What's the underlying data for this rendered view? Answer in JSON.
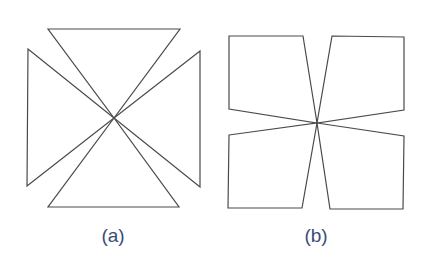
{
  "figure": {
    "line_color": "#4a4a4a",
    "label_color": "#3b4b7c",
    "panels": [
      {
        "id": "a",
        "label": "(a)",
        "label_center_x": 113,
        "description": "Four triangles meeting at a common central vertex",
        "center": [
          114,
          118
        ],
        "shapes": [
          {
            "name": "top-triangle",
            "points": [
              [
                48,
                29
              ],
              [
                180,
                29
              ],
              [
                114,
                118
              ]
            ]
          },
          {
            "name": "right-triangle",
            "points": [
              [
                200,
                51
              ],
              [
                200,
                187
              ],
              [
                114,
                118
              ]
            ]
          },
          {
            "name": "bottom-triangle",
            "points": [
              [
                48,
                207
              ],
              [
                179,
                207
              ],
              [
                114,
                118
              ]
            ]
          },
          {
            "name": "left-triangle",
            "points": [
              [
                28,
                49
              ],
              [
                27,
                186
              ],
              [
                114,
                118
              ]
            ]
          }
        ]
      },
      {
        "id": "b",
        "label": "(b)",
        "label_center_x": 316,
        "description": "Four quadrilaterals meeting at a common central vertex",
        "center": [
          317,
          123
        ],
        "shapes": [
          {
            "name": "top-left-quad",
            "points": [
              [
                229,
                36
              ],
              [
                303,
                36
              ],
              [
                317,
                123
              ],
              [
                229,
                109
              ]
            ]
          },
          {
            "name": "top-right-quad",
            "points": [
              [
                332,
                36
              ],
              [
                404,
                37
              ],
              [
                404,
                110
              ],
              [
                317,
                123
              ]
            ]
          },
          {
            "name": "bottom-left-quad",
            "points": [
              [
                229,
                135
              ],
              [
                317,
                123
              ],
              [
                302,
                208
              ],
              [
                228,
                208
              ]
            ]
          },
          {
            "name": "bottom-right-quad",
            "points": [
              [
                317,
                123
              ],
              [
                404,
                136
              ],
              [
                403,
                209
              ],
              [
                330,
                209
              ]
            ]
          }
        ]
      }
    ]
  }
}
